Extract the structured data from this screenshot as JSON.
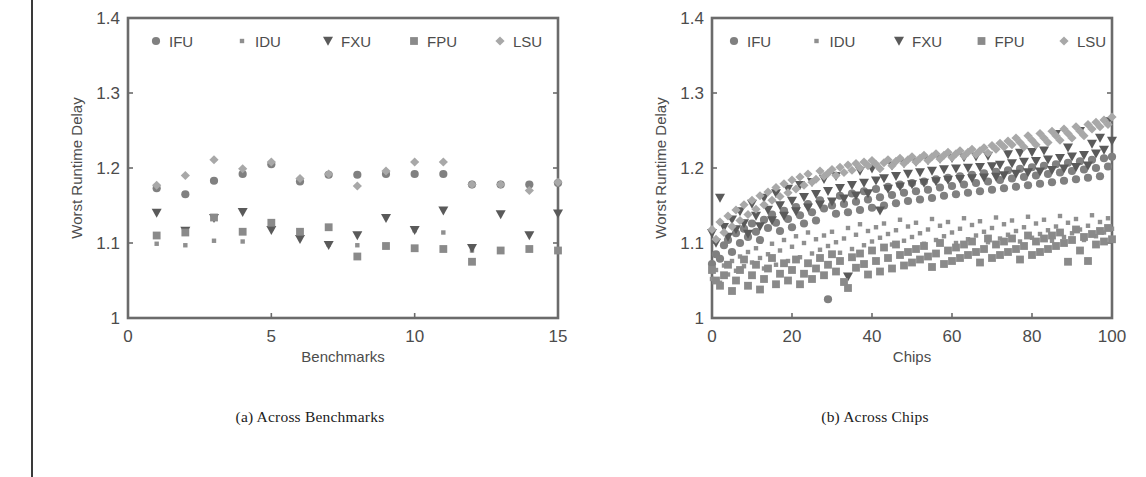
{
  "page": {
    "background_color": "#ffffff",
    "edge_rule_color": "#3a3a3a"
  },
  "legend": {
    "entries": [
      {
        "label": "IFU",
        "marker": "circle-marker",
        "color": "#808080"
      },
      {
        "label": "IDU",
        "marker": "small-square-marker",
        "color": "#8f8f8f"
      },
      {
        "label": "FXU",
        "marker": "triangle-down-marker",
        "color": "#5a5a5a"
      },
      {
        "label": "FPU",
        "marker": "square-marker",
        "color": "#8a8a8a"
      },
      {
        "label": "LSU",
        "marker": "diamond-marker",
        "color": "#a8a8a8"
      }
    ]
  },
  "figures": [
    {
      "caption": "(a) Across Benchmarks"
    },
    {
      "caption": "(b) Across Chips"
    }
  ],
  "chart_data": [
    {
      "type": "scatter",
      "title": "",
      "xlabel": "Benchmarks",
      "ylabel": "Worst Runtime Delay",
      "xlim": [
        0,
        15
      ],
      "ylim": [
        1,
        1.4
      ],
      "xticks": [
        0,
        5,
        10,
        15
      ],
      "xtick_labels": [
        "0",
        "5",
        "10",
        "15"
      ],
      "yticks": [
        1,
        1.1,
        1.2,
        1.3,
        1.4
      ],
      "ytick_labels": [
        "1",
        "1.1",
        "1.2",
        "1.3",
        "1.4"
      ],
      "grid": false,
      "legend_position": "top-inside",
      "x": [
        1,
        2,
        3,
        4,
        5,
        6,
        7,
        8,
        9,
        10,
        11,
        12,
        13,
        14,
        15
      ],
      "series": [
        {
          "name": "IFU",
          "marker": "circle-marker",
          "values": [
            1.173,
            1.165,
            1.183,
            1.192,
            1.205,
            1.182,
            1.191,
            1.191,
            1.192,
            1.192,
            1.192,
            1.178,
            1.178,
            1.178,
            1.18
          ]
        },
        {
          "name": "IDU",
          "marker": "small-square-marker",
          "values": [
            1.099,
            1.097,
            1.103,
            1.102,
            1.119,
            1.112,
            1.098,
            1.097,
            1.097,
            1.117,
            1.114,
            1.09,
            1.089,
            1.091,
            1.09
          ]
        },
        {
          "name": "FXU",
          "marker": "triangle-down-marker",
          "values": [
            1.14,
            1.116,
            1.133,
            1.141,
            1.117,
            1.105,
            1.097,
            1.11,
            1.133,
            1.117,
            1.143,
            1.093,
            1.138,
            1.11,
            1.139
          ]
        },
        {
          "name": "FPU",
          "marker": "square-marker",
          "values": [
            1.11,
            1.114,
            1.134,
            1.115,
            1.127,
            1.115,
            1.121,
            1.082,
            1.096,
            1.093,
            1.092,
            1.075,
            1.09,
            1.092,
            1.09
          ]
        },
        {
          "name": "LSU",
          "marker": "diamond-marker",
          "values": [
            1.177,
            1.19,
            1.211,
            1.199,
            1.208,
            1.186,
            1.192,
            1.176,
            1.196,
            1.208,
            1.208,
            1.178,
            1.178,
            1.17,
            1.181
          ]
        }
      ]
    },
    {
      "type": "scatter",
      "title": "",
      "xlabel": "Chips",
      "ylabel": "Worst Runtime Delay",
      "xlim": [
        0,
        100
      ],
      "ylim": [
        1,
        1.4
      ],
      "xticks": [
        0,
        20,
        40,
        60,
        80,
        100
      ],
      "xtick_labels": [
        "0",
        "20",
        "40",
        "60",
        "80",
        "100"
      ],
      "yticks": [
        1,
        1.1,
        1.2,
        1.3,
        1.4
      ],
      "ytick_labels": [
        "1",
        "1.1",
        "1.2",
        "1.3",
        "1.4"
      ],
      "grid": false,
      "legend_position": "top-inside",
      "note": "100 chips sorted by increasing delay; all five units trend upward from ~1.05-1.12 at chip 0 to ~1.14-1.30 at chip 100. LSU is the upper envelope, FPU/IDU the lower.",
      "x": [
        0,
        1,
        2,
        3,
        4,
        5,
        6,
        7,
        8,
        9,
        10,
        11,
        12,
        13,
        14,
        15,
        16,
        17,
        18,
        19,
        20,
        21,
        22,
        23,
        24,
        25,
        26,
        27,
        28,
        29,
        30,
        31,
        32,
        33,
        34,
        35,
        36,
        37,
        38,
        39,
        40,
        41,
        42,
        43,
        44,
        45,
        46,
        47,
        48,
        49,
        50,
        51,
        52,
        53,
        54,
        55,
        56,
        57,
        58,
        59,
        60,
        61,
        62,
        63,
        64,
        65,
        66,
        67,
        68,
        69,
        70,
        71,
        72,
        73,
        74,
        75,
        76,
        77,
        78,
        79,
        80,
        81,
        82,
        83,
        84,
        85,
        86,
        87,
        88,
        89,
        90,
        91,
        92,
        93,
        94,
        95,
        96,
        97,
        98,
        99,
        100
      ],
      "series": [
        {
          "name": "IFU",
          "marker": "circle-marker",
          "values": [
            1.072,
            1.085,
            1.079,
            1.097,
            1.104,
            1.088,
            1.113,
            1.1,
            1.119,
            1.108,
            1.126,
            1.115,
            1.104,
            1.131,
            1.12,
            1.138,
            1.127,
            1.116,
            1.143,
            1.132,
            1.121,
            1.148,
            1.137,
            1.126,
            1.152,
            1.141,
            1.13,
            1.157,
            1.146,
            1.025,
            1.15,
            1.139,
            1.163,
            1.152,
            1.141,
            1.166,
            1.155,
            1.144,
            1.169,
            1.158,
            1.147,
            1.172,
            1.161,
            1.15,
            1.175,
            1.164,
            1.153,
            1.178,
            1.167,
            1.156,
            1.18,
            1.169,
            1.158,
            1.182,
            1.171,
            1.16,
            1.185,
            1.174,
            1.163,
            1.187,
            1.176,
            1.165,
            1.189,
            1.178,
            1.167,
            1.191,
            1.18,
            1.169,
            1.193,
            1.182,
            1.171,
            1.195,
            1.184,
            1.173,
            1.197,
            1.186,
            1.175,
            1.199,
            1.188,
            1.177,
            1.201,
            1.19,
            1.179,
            1.203,
            1.192,
            1.181,
            1.205,
            1.194,
            1.183,
            1.207,
            1.196,
            1.185,
            1.209,
            1.198,
            1.187,
            1.211,
            1.2,
            1.189,
            1.213,
            1.202,
            1.215
          ]
        },
        {
          "name": "IDU",
          "marker": "small-square-marker",
          "values": [
            1.052,
            1.064,
            1.047,
            1.07,
            1.058,
            1.076,
            1.063,
            1.082,
            1.069,
            1.088,
            1.074,
            1.093,
            1.08,
            1.066,
            1.085,
            1.099,
            1.071,
            1.09,
            1.104,
            1.076,
            1.095,
            1.109,
            1.081,
            1.1,
            1.114,
            1.086,
            1.105,
            1.091,
            1.11,
            1.096,
            1.115,
            1.101,
            1.087,
            1.106,
            1.12,
            1.092,
            1.111,
            1.125,
            1.097,
            1.116,
            1.102,
            1.121,
            1.107,
            1.126,
            1.112,
            1.098,
            1.117,
            1.131,
            1.103,
            1.122,
            1.108,
            1.127,
            1.113,
            1.099,
            1.118,
            1.132,
            1.104,
            1.123,
            1.109,
            1.128,
            1.114,
            1.1,
            1.119,
            1.133,
            1.105,
            1.124,
            1.11,
            1.129,
            1.115,
            1.101,
            1.12,
            1.134,
            1.106,
            1.125,
            1.111,
            1.13,
            1.116,
            1.102,
            1.121,
            1.135,
            1.107,
            1.126,
            1.112,
            1.131,
            1.117,
            1.103,
            1.122,
            1.136,
            1.108,
            1.127,
            1.113,
            1.132,
            1.118,
            1.104,
            1.123,
            1.137,
            1.109,
            1.128,
            1.114,
            1.133,
            1.119
          ]
        },
        {
          "name": "FXU",
          "marker": "triangle-down-marker",
          "values": [
            1.113,
            1.1,
            1.16,
            1.121,
            1.108,
            1.131,
            1.118,
            1.142,
            1.126,
            1.112,
            1.152,
            1.136,
            1.122,
            1.16,
            1.144,
            1.13,
            1.166,
            1.15,
            1.136,
            1.172,
            1.156,
            1.142,
            1.177,
            1.161,
            1.147,
            1.181,
            1.165,
            1.151,
            1.185,
            1.169,
            1.155,
            1.189,
            1.173,
            1.159,
            1.055,
            1.177,
            1.163,
            1.196,
            1.18,
            1.166,
            1.199,
            1.183,
            1.143,
            1.186,
            1.172,
            1.203,
            1.189,
            1.175,
            1.206,
            1.192,
            1.178,
            1.208,
            1.194,
            1.18,
            1.21,
            1.196,
            1.182,
            1.212,
            1.198,
            1.184,
            1.213,
            1.199,
            1.185,
            1.214,
            1.2,
            1.186,
            1.215,
            1.201,
            1.187,
            1.216,
            1.202,
            1.188,
            1.204,
            1.19,
            1.218,
            1.206,
            1.192,
            1.22,
            1.208,
            1.194,
            1.221,
            1.209,
            1.195,
            1.223,
            1.211,
            1.197,
            1.245,
            1.213,
            1.199,
            1.227,
            1.215,
            1.201,
            1.249,
            1.217,
            1.203,
            1.232,
            1.219,
            1.24,
            1.224,
            1.262,
            1.236
          ]
        },
        {
          "name": "FPU",
          "marker": "square-marker",
          "values": [
            1.064,
            1.05,
            1.043,
            1.057,
            1.071,
            1.036,
            1.05,
            1.064,
            1.078,
            1.043,
            1.057,
            1.071,
            1.038,
            1.052,
            1.066,
            1.08,
            1.045,
            1.059,
            1.073,
            1.05,
            1.064,
            1.078,
            1.045,
            1.059,
            1.073,
            1.052,
            1.066,
            1.08,
            1.057,
            1.071,
            1.085,
            1.062,
            1.076,
            1.048,
            1.04,
            1.081,
            1.067,
            1.086,
            1.072,
            1.058,
            1.09,
            1.076,
            1.062,
            1.094,
            1.08,
            1.066,
            1.098,
            1.084,
            1.07,
            1.088,
            1.074,
            1.092,
            1.078,
            1.096,
            1.082,
            1.068,
            1.086,
            1.1,
            1.072,
            1.09,
            1.076,
            1.094,
            1.08,
            1.098,
            1.084,
            1.102,
            1.088,
            1.074,
            1.092,
            1.106,
            1.08,
            1.098,
            1.084,
            1.102,
            1.088,
            1.106,
            1.092,
            1.078,
            1.096,
            1.11,
            1.084,
            1.102,
            1.088,
            1.106,
            1.092,
            1.11,
            1.096,
            1.114,
            1.1,
            1.075,
            1.104,
            1.118,
            1.09,
            1.108,
            1.076,
            1.112,
            1.098,
            1.116,
            1.102,
            1.12,
            1.105
          ]
        },
        {
          "name": "LSU",
          "marker": "diamond-marker",
          "values": [
            1.118,
            1.105,
            1.128,
            1.114,
            1.136,
            1.122,
            1.144,
            1.13,
            1.151,
            1.138,
            1.157,
            1.145,
            1.163,
            1.151,
            1.168,
            1.157,
            1.174,
            1.162,
            1.179,
            1.167,
            1.184,
            1.172,
            1.188,
            1.177,
            1.192,
            1.181,
            1.185,
            1.196,
            1.189,
            1.193,
            1.198,
            1.19,
            1.201,
            1.194,
            1.204,
            1.197,
            1.206,
            1.2,
            1.208,
            1.203,
            1.21,
            1.205,
            1.199,
            1.207,
            1.211,
            1.203,
            1.209,
            1.213,
            1.206,
            1.211,
            1.215,
            1.208,
            1.213,
            1.217,
            1.21,
            1.215,
            1.219,
            1.212,
            1.217,
            1.221,
            1.214,
            1.219,
            1.223,
            1.216,
            1.221,
            1.225,
            1.218,
            1.223,
            1.227,
            1.22,
            1.23,
            1.225,
            1.233,
            1.228,
            1.236,
            1.231,
            1.24,
            1.234,
            1.228,
            1.243,
            1.237,
            1.231,
            1.246,
            1.24,
            1.234,
            1.249,
            1.243,
            1.237,
            1.252,
            1.246,
            1.24,
            1.255,
            1.249,
            1.243,
            1.258,
            1.252,
            1.261,
            1.255,
            1.264,
            1.258,
            1.268
          ]
        }
      ]
    }
  ]
}
